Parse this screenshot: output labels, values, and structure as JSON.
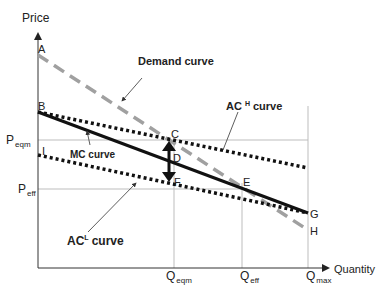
{
  "axes": {
    "y_label": "Price",
    "x_label": "Quantity"
  },
  "price_ticks": [
    {
      "main": "P",
      "sub": "eqm"
    },
    {
      "main": "P",
      "sub": "eff"
    }
  ],
  "quantity_ticks": [
    {
      "main": "Q",
      "sub": "eqm"
    },
    {
      "main": "Q",
      "sub": "eff"
    },
    {
      "main": "Q",
      "sub": "max"
    }
  ],
  "points": {
    "A": "A",
    "B": "B",
    "C": "C",
    "D": "D",
    "E": "E",
    "F": "F",
    "G": "G",
    "H": "H",
    "I": "I"
  },
  "curves": {
    "demand": "Demand curve",
    "ach_main": "AC",
    "ach_sup": "H",
    "ach_suffix": "curve",
    "mc": "MC curve",
    "acl_main": "AC",
    "acl_sup": "L",
    "acl_suffix": "curve"
  },
  "colors": {
    "demand": "#a0a0a0",
    "mc": "#111111",
    "ac": "#111111",
    "gridline": "#bdbdbd"
  }
}
